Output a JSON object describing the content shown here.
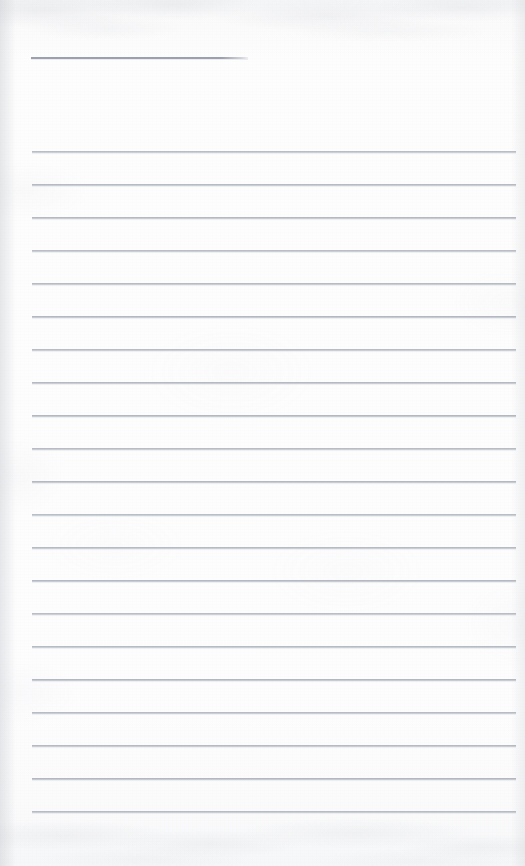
{
  "document": {
    "kind": "scanned-blank-ruled-note-page",
    "page_title_text": "",
    "body_text": "",
    "paper_color": "#fcfcfd",
    "rule_color": "#9ca2ae",
    "page_width": 525,
    "page_height": 866
  },
  "title_rule": {
    "label": "title-underline",
    "x": 31,
    "y": 57,
    "width": 217,
    "thickness": 2
  },
  "ruled_lines": {
    "label": "ruled-writing-lines",
    "count": 21,
    "left": 32,
    "right": 516,
    "width": 484,
    "first_y": 151,
    "spacing": 33,
    "thickness": 2,
    "y_positions": [
      151,
      184,
      217,
      250,
      283,
      316,
      349,
      382,
      415,
      448,
      481,
      514,
      547,
      580,
      613,
      646,
      679,
      712,
      745,
      778,
      811
    ]
  },
  "margins": {
    "top_blank_height": 57,
    "gap_after_title": 94,
    "bottom_blank_height": 55,
    "left_margin": 32,
    "right_margin": 9
  }
}
